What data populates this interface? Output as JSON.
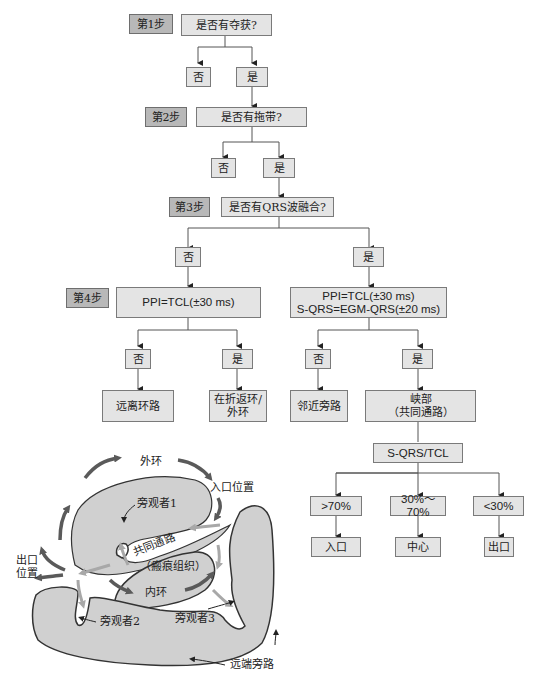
{
  "flowchart": {
    "steps": [
      "第1步",
      "第2步",
      "第3步",
      "第4步"
    ],
    "q1": "是否有夺获?",
    "q1_no": "否",
    "q1_yes": "是",
    "q2": "是否有拖带?",
    "q2_no": "否",
    "q2_yes": "是",
    "q3": "是否有QRS波融合?",
    "q3_no": "否",
    "q3_yes": "是",
    "q4_left": "PPI=TCL(±30 ms)",
    "q4_right": "PPI=TCL(±30 ms)\nS-QRS=EGM-QRS(±20 ms)",
    "q4_left_no": "否",
    "q4_left_yes": "是",
    "q4_right_no": "否",
    "q4_right_yes": "是",
    "result_remote": "远离环路",
    "result_outer": "在折返环/\n外环",
    "result_adjacent": "邻近旁路",
    "result_isthmus": "峡部\n（共同通路）",
    "ratio_box": "S-QRS/TCL",
    "ratio_high": ">70%",
    "ratio_mid": "30%～70%",
    "ratio_low": "<30%",
    "loc_entry": "入口",
    "loc_center": "中心",
    "loc_exit": "出口"
  },
  "anatomy": {
    "outer_loop": "外环",
    "entry_site": "入口位置",
    "bystander1": "旁观者1",
    "common_pathway": "共同通路",
    "scar": "（瘢痕组织）",
    "exit_site": "出口\n位置",
    "inner_loop": "内环",
    "bystander2": "旁观者2",
    "bystander3": "旁观者3",
    "remote_bystander": "远端旁路"
  },
  "colors": {
    "box_fill": "#e4e4e4",
    "step_fill": "#b8b8b8",
    "tissue_fill": "#d0d0d0",
    "arrow_dark": "#5a5a5a",
    "arrow_light": "#a8a8a8"
  }
}
